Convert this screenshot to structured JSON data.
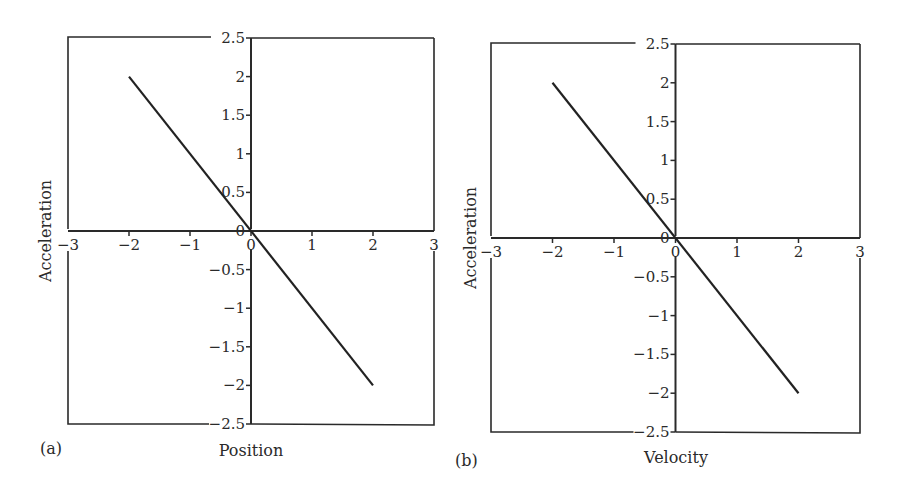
{
  "chart_data": [
    {
      "id": "a",
      "type": "line",
      "panel_label": "(a)",
      "title": "",
      "xlabel": "Position",
      "ylabel": "Acceleration",
      "xlim": [
        -3,
        3
      ],
      "ylim": [
        -2.5,
        2.5
      ],
      "grid": false,
      "x_ticks": [
        -3,
        -2,
        -1,
        0,
        1,
        2,
        3
      ],
      "x_tick_labels": [
        "−3",
        "−2",
        "−1",
        "0",
        "1",
        "2",
        "3"
      ],
      "y_ticks": [
        2.5,
        2,
        1.5,
        1,
        0.5,
        0,
        -0.5,
        -1,
        -1.5,
        -2,
        -2.5
      ],
      "y_tick_labels": [
        "2.5",
        "2",
        "1.5",
        "1",
        "0.5",
        "0",
        "−0.5",
        "−1",
        "−1.5",
        "−2",
        "−2.5"
      ],
      "series": [
        {
          "name": "acceleration vs position",
          "x": [
            -2,
            2
          ],
          "y": [
            2,
            -2
          ]
        }
      ],
      "layout": {
        "left": 68,
        "right": 434,
        "top": 38,
        "bottom": 424
      }
    },
    {
      "id": "b",
      "type": "line",
      "panel_label": "(b)",
      "title": "",
      "xlabel": "Velocity",
      "ylabel": "Acceleration",
      "xlim": [
        -3,
        3
      ],
      "ylim": [
        -2.5,
        2.5
      ],
      "grid": false,
      "x_ticks": [
        -3,
        -2,
        -1,
        0,
        1,
        2,
        3
      ],
      "x_tick_labels": [
        "−3",
        "−2",
        "−1",
        "0",
        "1",
        "2",
        "3"
      ],
      "y_ticks": [
        2.5,
        2,
        1.5,
        1,
        0.5,
        0,
        -0.5,
        -1,
        -1.5,
        -2,
        -2.5
      ],
      "y_tick_labels": [
        "2.5",
        "2",
        "1.5",
        "1",
        "0.5",
        "0",
        "−0.5",
        "−1",
        "−1.5",
        "−2",
        "−2.5"
      ],
      "series": [
        {
          "name": "acceleration vs velocity",
          "x": [
            -2,
            2
          ],
          "y": [
            2,
            -2
          ]
        }
      ],
      "layout": {
        "left": 491,
        "right": 860,
        "top": 44,
        "bottom": 432
      }
    }
  ],
  "panels": {
    "a": {
      "label": "(a)",
      "xlabel": "Position",
      "ylabel": "Acceleration"
    },
    "b": {
      "label": "(b)",
      "xlabel": "Velocity",
      "ylabel": "Acceleration"
    }
  }
}
